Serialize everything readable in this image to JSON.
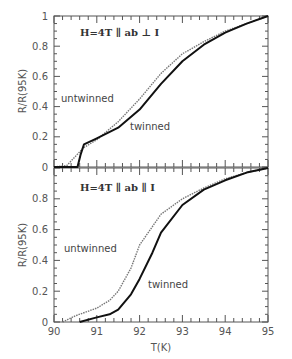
{
  "chart_data": [
    {
      "type": "line",
      "panel": "top",
      "annotation": "H=4T ∥ ab ⊥ I",
      "xlabel": "",
      "ylabel": "R/R(95K)",
      "xlim": [
        90,
        95
      ],
      "ylim": [
        0,
        1
      ],
      "yticks": [
        "0",
        "0.2",
        "0.4",
        "0.6",
        "0.8",
        "1"
      ],
      "grid": false,
      "series": [
        {
          "name": "untwinned",
          "style": "open-markers",
          "x": [
            90.0,
            90.3,
            90.5,
            90.7,
            91.0,
            91.5,
            92.0,
            92.5,
            93.0,
            93.5,
            94.0,
            94.5,
            95.0
          ],
          "values": [
            0.0,
            0.01,
            0.07,
            0.13,
            0.18,
            0.3,
            0.45,
            0.62,
            0.75,
            0.83,
            0.9,
            0.95,
            1.0
          ]
        },
        {
          "name": "twinned",
          "style": "filled-markers",
          "x": [
            90.0,
            90.55,
            90.62,
            90.7,
            91.0,
            91.5,
            92.0,
            92.5,
            93.0,
            93.5,
            94.0,
            94.5,
            95.0
          ],
          "values": [
            0.0,
            0.0,
            0.08,
            0.15,
            0.19,
            0.26,
            0.38,
            0.55,
            0.7,
            0.81,
            0.89,
            0.95,
            1.0
          ]
        }
      ]
    },
    {
      "type": "line",
      "panel": "bottom",
      "annotation": "H=4T ∥ ab ∥ I",
      "xlabel": "T(K)",
      "ylabel": "R/R(95K)",
      "xlim": [
        90,
        95
      ],
      "ylim": [
        0,
        1
      ],
      "xticks": [
        "90",
        "91",
        "92",
        "93",
        "94",
        "95"
      ],
      "yticks": [
        "0",
        "0.2",
        "0.4",
        "0.6",
        "0.8"
      ],
      "grid": false,
      "series": [
        {
          "name": "untwinned",
          "style": "open-markers",
          "x": [
            90.2,
            90.5,
            91.0,
            91.3,
            91.5,
            91.8,
            92.0,
            92.5,
            93.0,
            93.5,
            94.0,
            94.5,
            95.0
          ],
          "values": [
            0.0,
            0.04,
            0.09,
            0.14,
            0.2,
            0.35,
            0.5,
            0.7,
            0.8,
            0.87,
            0.93,
            0.97,
            1.0
          ]
        },
        {
          "name": "twinned",
          "style": "filled-markers",
          "x": [
            90.6,
            91.0,
            91.3,
            91.5,
            91.8,
            92.0,
            92.3,
            92.5,
            93.0,
            93.5,
            94.0,
            94.5,
            95.0
          ],
          "values": [
            0.0,
            0.03,
            0.05,
            0.08,
            0.18,
            0.28,
            0.45,
            0.58,
            0.76,
            0.86,
            0.92,
            0.97,
            1.0
          ]
        }
      ]
    }
  ],
  "labels": {
    "top_annotation": "H=4T ∥ ab ⊥ I",
    "bottom_annotation": "H=4T ∥ ab ∥ I",
    "ylabel": "R/R(95K)",
    "xlabel": "T(K)",
    "untwinned": "untwinned",
    "twinned": "twinned"
  }
}
